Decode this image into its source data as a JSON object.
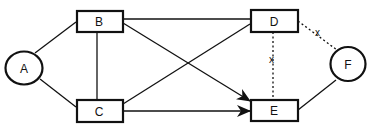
{
  "diagram": {
    "colors": {
      "stroke": "#111111",
      "background": "#ffffff"
    },
    "nodes": [
      {
        "id": "A",
        "label": "A",
        "shape": "circle"
      },
      {
        "id": "B",
        "label": "B",
        "shape": "box"
      },
      {
        "id": "C",
        "label": "C",
        "shape": "box"
      },
      {
        "id": "D",
        "label": "D",
        "shape": "box"
      },
      {
        "id": "E",
        "label": "E",
        "shape": "box"
      },
      {
        "id": "F",
        "label": "F",
        "shape": "circle"
      }
    ],
    "edges": [
      {
        "from": "A",
        "to": "B",
        "style": "solid",
        "arrow": false
      },
      {
        "from": "A",
        "to": "C",
        "style": "solid",
        "arrow": false
      },
      {
        "from": "B",
        "to": "C",
        "style": "solid",
        "arrow": false
      },
      {
        "from": "B",
        "to": "D",
        "style": "solid",
        "arrow": false
      },
      {
        "from": "B",
        "to": "E",
        "style": "solid",
        "arrow": true
      },
      {
        "from": "C",
        "to": "D",
        "style": "solid",
        "arrow": false
      },
      {
        "from": "C",
        "to": "E",
        "style": "solid",
        "arrow": true
      },
      {
        "from": "D",
        "to": "E",
        "style": "dotted",
        "arrow": false,
        "label": "x"
      },
      {
        "from": "D",
        "to": "F",
        "style": "dotted",
        "arrow": false,
        "label": "x"
      },
      {
        "from": "E",
        "to": "F",
        "style": "solid",
        "arrow": false
      }
    ]
  }
}
